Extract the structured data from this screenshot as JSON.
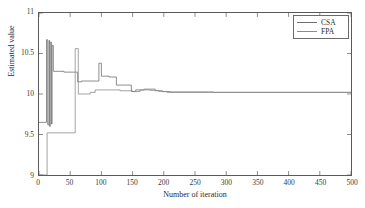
{
  "chart_data": {
    "type": "line",
    "title": "",
    "xlabel": "Number of iteration",
    "ylabel": "Estimated value",
    "xlim": [
      0,
      500
    ],
    "ylim": [
      9,
      11
    ],
    "xticks": [
      0,
      50,
      100,
      150,
      200,
      250,
      300,
      350,
      400,
      450,
      500
    ],
    "yticks": [
      9,
      9.5,
      10,
      10.5,
      11
    ],
    "xticklabels": [
      "0",
      "50",
      "100",
      "150",
      "200",
      "250",
      "300",
      "350",
      "400",
      "450",
      "500"
    ],
    "yticklabels": [
      "9",
      "9.5",
      "10",
      "10.5",
      "11"
    ],
    "grid": false,
    "legend_position": "top-right",
    "series": [
      {
        "name": "CSA",
        "color": "#707070",
        "step": true,
        "points": [
          [
            0,
            9.65
          ],
          [
            12,
            9.65
          ],
          [
            12,
            10.67
          ],
          [
            14,
            10.67
          ],
          [
            14,
            9.62
          ],
          [
            16,
            9.62
          ],
          [
            16,
            10.66
          ],
          [
            17,
            10.66
          ],
          [
            17,
            9.6
          ],
          [
            18,
            9.6
          ],
          [
            18,
            10.64
          ],
          [
            20,
            10.64
          ],
          [
            20,
            9.63
          ],
          [
            21,
            9.63
          ],
          [
            21,
            10.6
          ],
          [
            23,
            10.6
          ],
          [
            23,
            10.28
          ],
          [
            40,
            10.28
          ],
          [
            40,
            10.27
          ],
          [
            62,
            10.27
          ],
          [
            62,
            10.15
          ],
          [
            68,
            10.15
          ],
          [
            68,
            10.16
          ],
          [
            96,
            10.16
          ],
          [
            96,
            10.38
          ],
          [
            100,
            10.38
          ],
          [
            100,
            10.22
          ],
          [
            112,
            10.22
          ],
          [
            112,
            10.21
          ],
          [
            124,
            10.21
          ],
          [
            124,
            10.11
          ],
          [
            148,
            10.11
          ],
          [
            148,
            10.03
          ],
          [
            155,
            10.03
          ],
          [
            155,
            10.05
          ],
          [
            168,
            10.05
          ],
          [
            168,
            10.06
          ],
          [
            186,
            10.06
          ],
          [
            186,
            10.04
          ],
          [
            198,
            10.04
          ],
          [
            198,
            10.03
          ],
          [
            210,
            10.03
          ],
          [
            210,
            10.025
          ],
          [
            280,
            10.025
          ],
          [
            280,
            10.02
          ],
          [
            500,
            10.02
          ]
        ]
      },
      {
        "name": "FPA",
        "color": "#8a8a8a",
        "step": true,
        "points": [
          [
            0,
            9.0
          ],
          [
            13,
            9.0
          ],
          [
            13,
            9.52
          ],
          [
            58,
            9.52
          ],
          [
            58,
            10.56
          ],
          [
            63,
            10.56
          ],
          [
            63,
            10.0
          ],
          [
            82,
            10.0
          ],
          [
            82,
            10.02
          ],
          [
            90,
            10.02
          ],
          [
            90,
            10.05
          ],
          [
            130,
            10.05
          ],
          [
            130,
            10.04
          ],
          [
            150,
            10.04
          ],
          [
            150,
            10.03
          ],
          [
            162,
            10.03
          ],
          [
            162,
            10.05
          ],
          [
            178,
            10.05
          ],
          [
            178,
            10.045
          ],
          [
            192,
            10.045
          ],
          [
            192,
            10.03
          ],
          [
            205,
            10.03
          ],
          [
            205,
            10.02
          ],
          [
            500,
            10.02
          ]
        ]
      }
    ]
  },
  "legend": {
    "items": [
      {
        "label": "CSA",
        "color": "#707070"
      },
      {
        "label": "FPA",
        "color": "#8a8a8a"
      }
    ]
  },
  "axes": {
    "x_title": "Number of iteration",
    "y_title": "Estimated value"
  }
}
